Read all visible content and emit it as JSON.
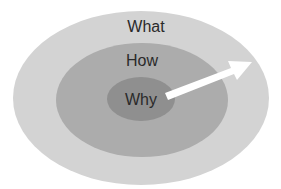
{
  "diagram": {
    "type": "concentric-circles",
    "rings": [
      {
        "label": "What",
        "color": "#d3d3d3"
      },
      {
        "label": "How",
        "color": "#acacac"
      },
      {
        "label": "Why",
        "color": "#8f8f8f"
      }
    ],
    "arrow": {
      "direction": "outward",
      "color": "#ffffff"
    }
  }
}
